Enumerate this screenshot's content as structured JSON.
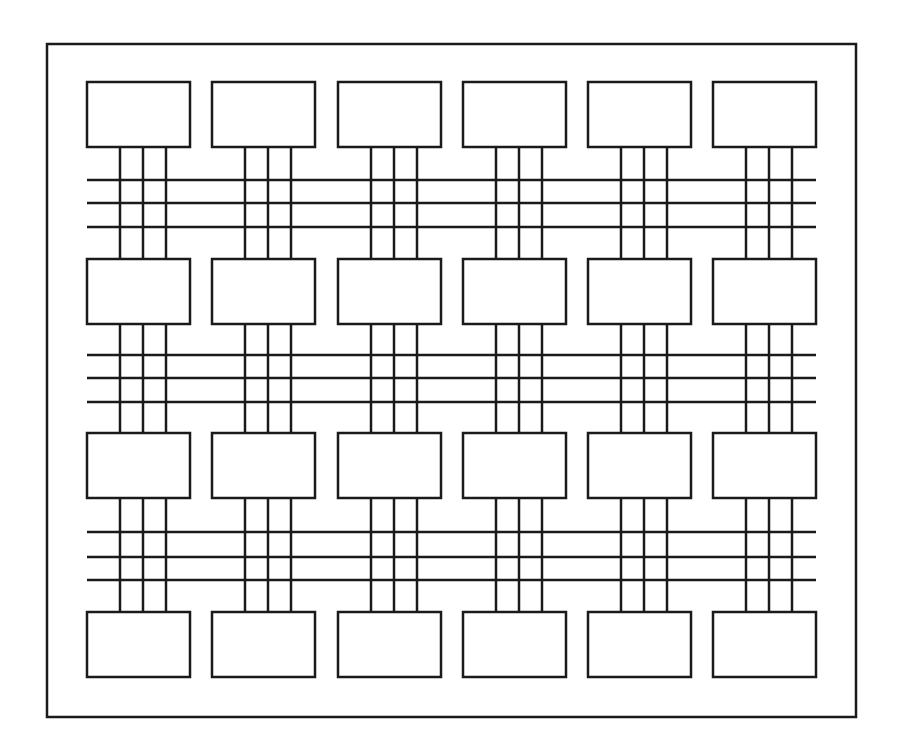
{
  "diagram": {
    "title": "",
    "type": "grid-interconnect",
    "colors": {
      "stroke": "#1a1a1a",
      "fill": "#ffffff",
      "background": "#ffffff"
    },
    "stroke_width": 2.5,
    "frame": {
      "x": 47,
      "y": 44,
      "width": 809,
      "height": 673
    },
    "block_size": {
      "width": 103,
      "height": 65
    },
    "columns_x": [
      87,
      212,
      338,
      463,
      588,
      713
    ],
    "rows_y": [
      82,
      259,
      433,
      612
    ],
    "vertical_line_offsets": [
      33,
      56,
      79
    ],
    "bus_groups": [
      {
        "y": [
          180,
          203,
          227
        ]
      },
      {
        "y": [
          355,
          378,
          402
        ]
      },
      {
        "y": [
          532,
          557,
          580
        ]
      }
    ],
    "bus_x_range": [
      87,
      816
    ]
  }
}
